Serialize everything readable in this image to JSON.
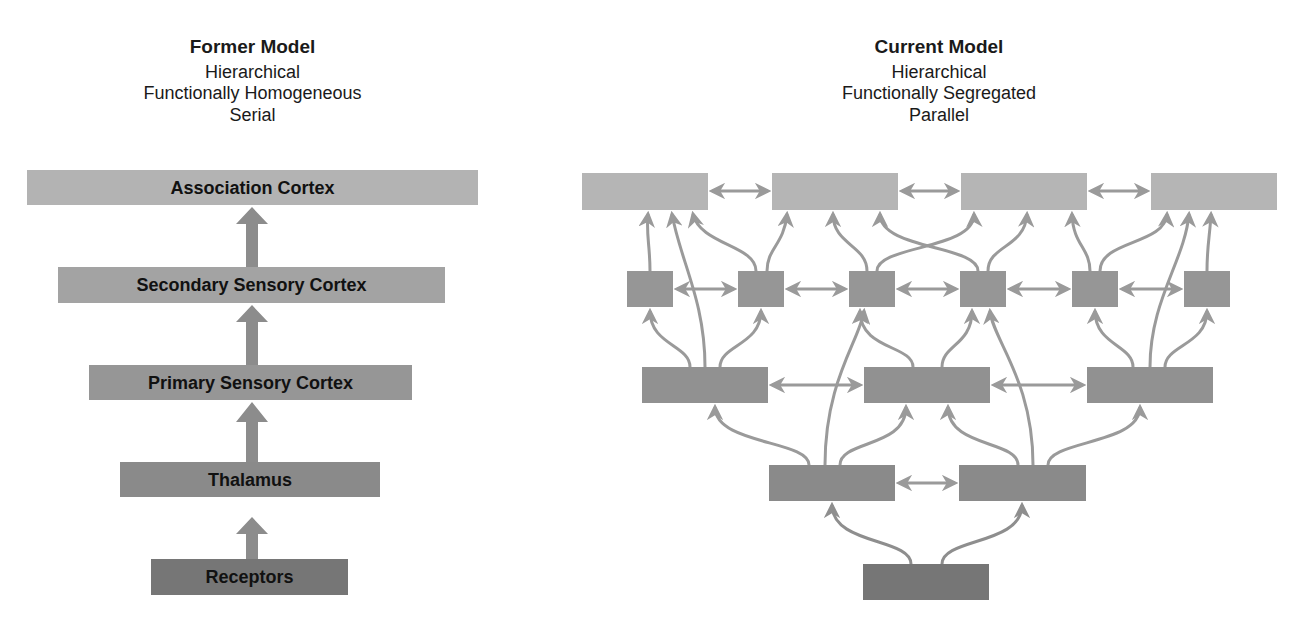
{
  "former_model": {
    "title": "Former Model",
    "properties": [
      "Hierarchical",
      "Functionally Homogeneous",
      "Serial"
    ],
    "levels": [
      {
        "label": "Association Cortex",
        "x": 27,
        "y": 170,
        "w": 451,
        "h": 35,
        "color": "#b3b3b3"
      },
      {
        "label": "Secondary Sensory Cortex",
        "x": 58,
        "y": 267,
        "w": 387,
        "h": 36,
        "color": "#a3a3a3"
      },
      {
        "label": "Primary Sensory Cortex",
        "x": 89,
        "y": 365,
        "w": 323,
        "h": 35,
        "color": "#969696"
      },
      {
        "label": "Thalamus",
        "x": 120,
        "y": 462,
        "w": 260,
        "h": 35,
        "color": "#8a8a8a"
      },
      {
        "label": "Receptors",
        "x": 151,
        "y": 559,
        "w": 197,
        "h": 36,
        "color": "#767676"
      }
    ]
  },
  "current_model": {
    "title": "Current Model",
    "properties": [
      "Hierarchical",
      "Functionally Segregated",
      "Parallel"
    ],
    "rows": [
      {
        "color": "#b5b5b5",
        "y": 173,
        "h": 37,
        "boxes": [
          [
            582,
            126
          ],
          [
            772,
            126
          ],
          [
            961,
            126
          ],
          [
            1151,
            126
          ]
        ]
      },
      {
        "color": "#969696",
        "y": 271,
        "h": 36,
        "boxes": [
          [
            627,
            46
          ],
          [
            738,
            46
          ],
          [
            849,
            46
          ],
          [
            960,
            46
          ],
          [
            1072,
            46
          ],
          [
            1184,
            46
          ]
        ]
      },
      {
        "color": "#919191",
        "y": 367,
        "h": 36,
        "boxes": [
          [
            642,
            126
          ],
          [
            864,
            126
          ],
          [
            1087,
            126
          ]
        ]
      },
      {
        "color": "#8a8a8a",
        "y": 465,
        "h": 36,
        "boxes": [
          [
            769,
            126
          ],
          [
            959,
            127
          ]
        ]
      },
      {
        "color": "#767676",
        "y": 564,
        "h": 36,
        "boxes": [
          [
            863,
            126
          ]
        ]
      }
    ]
  },
  "colors": {
    "arrow": "#9a9a9a",
    "block_arrow": "#8c8c8c",
    "text": "#111111"
  }
}
